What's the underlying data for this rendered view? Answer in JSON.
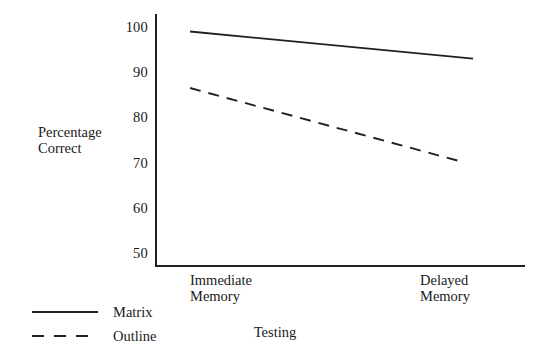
{
  "chart_data": {
    "type": "line",
    "title": "",
    "xlabel": "Testing",
    "ylabel": "Percentage\nCorrect",
    "ylabel_lines": [
      "Percentage",
      "Correct"
    ],
    "categories": [
      "Immediate\nMemory",
      "Delayed\nMemory"
    ],
    "category_lines": [
      [
        "Immediate",
        "Memory"
      ],
      [
        "Delayed",
        "Memory"
      ]
    ],
    "x": [
      0,
      1
    ],
    "ylim": [
      50,
      100
    ],
    "yticks": [
      100,
      90,
      80,
      70,
      60,
      50
    ],
    "ytick_labels": [
      "100",
      "90",
      "80",
      "70",
      "60",
      "50"
    ],
    "grid": false,
    "legend_position": "bottom-left",
    "series": [
      {
        "name": "Matrix",
        "style": "solid",
        "color": "#231f20",
        "values": [
          99,
          93
        ]
      },
      {
        "name": "Outline",
        "style": "dashed",
        "color": "#231f20",
        "values": [
          86.5,
          70
        ]
      }
    ]
  },
  "legend": {
    "items": [
      {
        "label": "Matrix",
        "style": "solid"
      },
      {
        "label": "Outline",
        "style": "dashed"
      }
    ]
  },
  "colors": {
    "ink": "#231f20",
    "background": "#ffffff"
  }
}
